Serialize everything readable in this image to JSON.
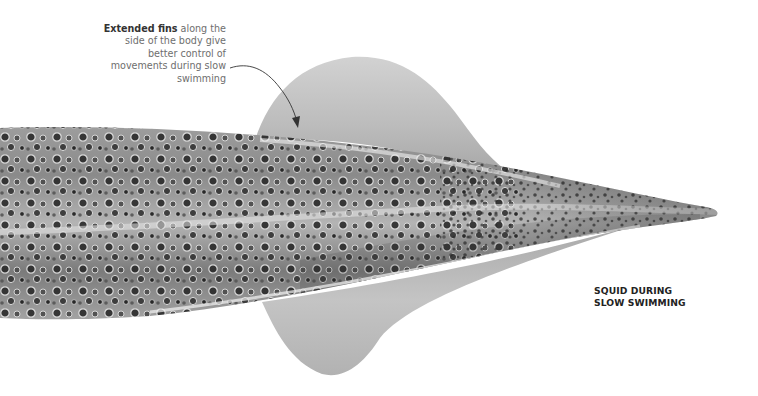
{
  "figure": {
    "colors": {
      "background": "#ffffff",
      "fin": "#bdbdbd",
      "body_light": "#c9c9c9",
      "body_dark": "#5a5a5a",
      "spots": "#1e1e1e",
      "arrow": "#333333"
    }
  },
  "annotation": {
    "bold": "Extended fins",
    "rest": " along the side of the body give better control of movements during slow swimming"
  },
  "caption": {
    "line1": "SQUID DURING",
    "line2": "SLOW SWIMMING"
  }
}
